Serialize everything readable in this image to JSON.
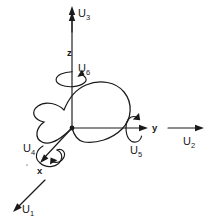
{
  "figure": {
    "background_color": "#ffffff",
    "line_color": "#1a1a1a"
  },
  "axes": [
    {
      "id": "x",
      "label": "x",
      "direction": "down-left",
      "kind": "axis"
    },
    {
      "id": "y",
      "label": "y",
      "direction": "right",
      "kind": "axis"
    },
    {
      "id": "z",
      "label": "z",
      "direction": "up",
      "kind": "axis"
    }
  ],
  "dof": {
    "translations": [
      {
        "id": "U1",
        "base": "U",
        "sub": "1",
        "axis": "x",
        "direction": "down-left",
        "kind": "translation"
      },
      {
        "id": "U2",
        "base": "U",
        "sub": "2",
        "axis": "y",
        "direction": "right",
        "kind": "translation"
      },
      {
        "id": "U3",
        "base": "U",
        "sub": "3",
        "axis": "z",
        "direction": "up",
        "kind": "translation"
      }
    ],
    "rotations": [
      {
        "id": "U4",
        "base": "U",
        "sub": "4",
        "axis": "x",
        "kind": "rotation"
      },
      {
        "id": "U5",
        "base": "U",
        "sub": "5",
        "axis": "y",
        "kind": "rotation"
      },
      {
        "id": "U6",
        "base": "U",
        "sub": "6",
        "axis": "z",
        "kind": "rotation"
      }
    ]
  },
  "body": {
    "name": "rigid-body-outline",
    "shape": "closed free-form blob centered near origin"
  },
  "origin": {
    "name": "origin-point",
    "x": 72,
    "y": 128
  }
}
